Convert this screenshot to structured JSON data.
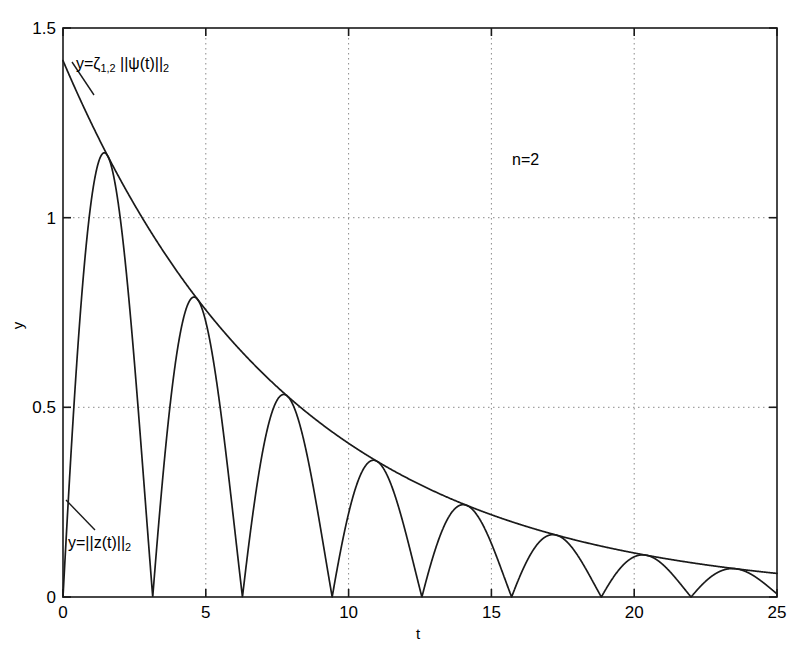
{
  "figure": {
    "kind": "matlab-line-plot",
    "background": "#ffffff",
    "line_color": "#1a1a1a",
    "grid_color": "#8a8a8a"
  },
  "axes": {
    "xlabel": "t",
    "ylabel": "y",
    "xticks": [
      "0",
      "5",
      "10",
      "15",
      "20",
      "25"
    ],
    "yticks": [
      "0",
      "0.5",
      "1",
      "1.5"
    ]
  },
  "annotations": {
    "envelope_label_lhs": "y=",
    "envelope_label_zeta": "ζ",
    "envelope_label_zeta_sub": "1,2",
    "envelope_label_rhs": " ||ψ(t)||",
    "envelope_label_rhs_sub": "2",
    "signal_label_lhs": "y=||z(t)||",
    "signal_label_sub": "2",
    "order_label": "n=2"
  },
  "chart_data": {
    "type": "line",
    "title": "",
    "xlabel": "t",
    "ylabel": "y",
    "xlim": [
      0,
      25
    ],
    "ylim": [
      0,
      1.5
    ],
    "xticks": [
      0,
      5,
      10,
      15,
      20,
      25
    ],
    "yticks": [
      0,
      0.5,
      1,
      1.5
    ],
    "grid": true,
    "grid_style": "dotted",
    "legend": "none",
    "annotations": [
      {
        "text": "y=ζ_{1,2} ||ψ(t)||_2",
        "x": 1.3,
        "y": 1.37,
        "leader_to": [
          1.6,
          1.21
        ]
      },
      {
        "text": "y=||z(t)||_2",
        "x": 0.45,
        "y": 0.2,
        "leader_to": [
          0.22,
          0.34
        ]
      },
      {
        "text": "n=2",
        "x": 15.5,
        "y": 1.23
      }
    ],
    "series": [
      {
        "name": "y=ζ_{1,2} ||ψ(t)||_2",
        "role": "envelope",
        "model": "A*exp(-k*t)",
        "A": 1.414,
        "k": 0.125,
        "x": [
          0,
          1,
          2,
          3,
          4,
          5,
          6,
          7,
          8,
          9,
          10,
          11,
          12,
          13,
          14,
          15,
          16,
          17,
          18,
          19,
          20,
          21,
          22,
          23,
          24,
          25
        ],
        "y": [
          1.414,
          1.248,
          1.101,
          0.972,
          0.858,
          0.757,
          0.668,
          0.589,
          0.52,
          0.459,
          0.405,
          0.357,
          0.315,
          0.278,
          0.246,
          0.217,
          0.191,
          0.169,
          0.149,
          0.132,
          0.116,
          0.103,
          0.091,
          0.08,
          0.071,
          0.062
        ]
      },
      {
        "name": "y=||z(t)||_2",
        "role": "oscillation",
        "model": "A*exp(-k*t)*|sin(t)|",
        "A": 1.414,
        "k": 0.125,
        "period": 3.1416,
        "zeros": [
          0,
          3.14,
          6.28,
          9.42,
          12.57,
          15.71,
          18.85,
          21.99,
          25.13
        ],
        "peak_times": [
          1.42,
          4.55,
          7.7,
          10.85,
          14.0,
          17.15,
          20.3,
          23.45
        ],
        "peak_values": [
          1.2,
          0.81,
          0.545,
          0.368,
          0.249,
          0.168,
          0.113,
          0.076
        ]
      }
    ]
  }
}
